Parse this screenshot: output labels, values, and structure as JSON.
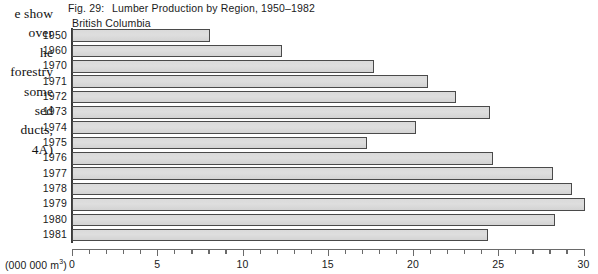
{
  "bleed_text": {
    "lines": [
      "e show",
      "over",
      "he",
      "forestry",
      "some",
      "sed",
      "ducts,",
      "4A)"
    ]
  },
  "figure": {
    "fig_number": "Fig. 29:",
    "title": "Lumber Production by Region, 1950–1982",
    "region": "British Columbia",
    "unit_label_text": "(000 000 m",
    "unit_label_sup": "3",
    "unit_label_close": ")"
  },
  "chart_data": {
    "type": "bar",
    "orientation": "horizontal",
    "title": "Lumber Production by Region, 1950–1982",
    "subtitle": "British Columbia",
    "xlabel": "(000 000 m3)",
    "ylabel": "",
    "xlim": [
      0,
      30
    ],
    "grid": false,
    "legend": "none",
    "categories": [
      "1950",
      "1960",
      "1970",
      "1971",
      "1972",
      "1973",
      "1974",
      "1975",
      "1976",
      "1977",
      "1978",
      "1979",
      "1980",
      "1981"
    ],
    "values": [
      8.1,
      12.3,
      17.7,
      20.9,
      22.5,
      24.5,
      20.2,
      17.3,
      24.7,
      28.2,
      29.3,
      30.1,
      28.3,
      24.4
    ],
    "xticks_major": [
      0,
      5,
      10,
      15,
      20,
      25,
      30
    ],
    "xtick_labels": [
      "0",
      "5",
      "10",
      "15",
      "20",
      "25",
      "30"
    ],
    "xtick_minor_step": 1,
    "bar_fill_color": "#d8d8d8",
    "bar_border_color": "#4a4a4a",
    "axis_color": "#3a3a3a",
    "background_color": "#ffffff"
  }
}
